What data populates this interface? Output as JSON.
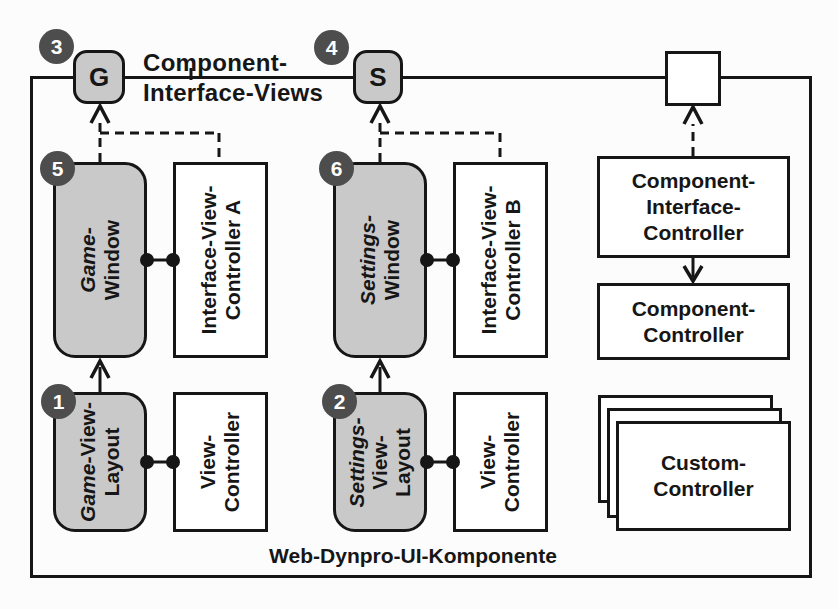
{
  "figure": {
    "bottom_label": "Web-Dynpro-UI-Komponente",
    "interface_views_label": {
      "line1": "Component-",
      "line2": "Interface-Views"
    },
    "ports": {
      "game": "G",
      "settings": "S"
    },
    "badges": {
      "b1": "1",
      "b2": "2",
      "b3": "3",
      "b4": "4",
      "b5": "5",
      "b6": "6"
    },
    "boxes": {
      "game_window": {
        "italic_part": "Game-",
        "line2": "Window"
      },
      "settings_window": {
        "italic_part": "Settings-",
        "line2": "Window"
      },
      "game_view_layout": {
        "italic_part": "Game-",
        "line1_rest": "View-",
        "line2": "Layout"
      },
      "settings_view_layout": {
        "italic_part": "Settings-",
        "line2": "View-",
        "line3": "Layout"
      },
      "interface_view_controller_a": {
        "line1": "Interface-View-",
        "line2": "Controller A"
      },
      "interface_view_controller_b": {
        "line1": "Interface-View-",
        "line2": "Controller B"
      },
      "view_controller_left": {
        "line1": "View-",
        "line2": "Controller"
      },
      "view_controller_right": {
        "line1": "View-",
        "line2": "Controller"
      },
      "component_interface_controller": {
        "line1": "Component-",
        "line2": "Interface-",
        "line3": "Controller"
      },
      "component_controller": {
        "line1": "Component-",
        "line2": "Controller"
      },
      "custom_controller": {
        "line1": "Custom-",
        "line2": "Controller"
      }
    },
    "colors": {
      "shaded_box_fill": "#c9c9c9",
      "badge_fill": "#4d4d4d",
      "line": "#161616",
      "background": "#fcfcfc"
    }
  }
}
